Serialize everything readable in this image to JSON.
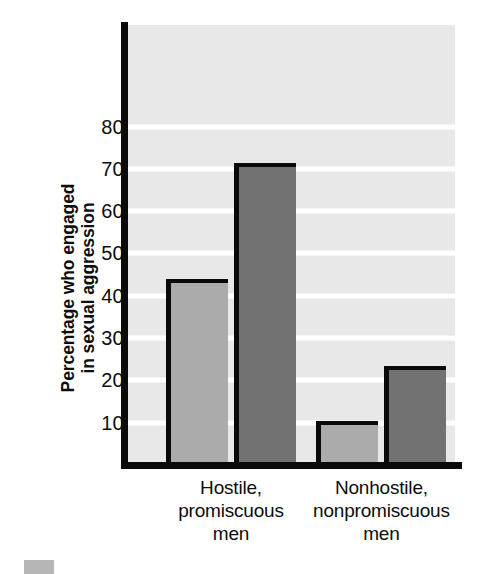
{
  "chart_data": {
    "type": "bar",
    "title": "",
    "xlabel": "",
    "ylabel": "Percentage who engaged\nin sexual aggression",
    "categories": [
      "Hostile,\npromiscuous\nmen",
      "Nonhostile,\nnonpromiscuous\nmen"
    ],
    "series": [
      {
        "name": "light-series",
        "values": [
          44,
          10.5
        ],
        "color": "#ababab"
      },
      {
        "name": "dark-series",
        "values": [
          71.5,
          23.5
        ],
        "color": "#727272"
      }
    ],
    "yticks": [
      10,
      20,
      30,
      40,
      50,
      60,
      70,
      80
    ],
    "ytick_labels": [
      "10",
      "20",
      "30",
      "40",
      "50",
      "60",
      "70",
      "80"
    ],
    "ylim": [
      0,
      104
    ],
    "grid": true,
    "grid_color": "#ffffff",
    "plot_background": "#e8e8e8",
    "axis_color": "#0a0a0a",
    "legend_position": "below-axis-clipped"
  },
  "axis": {
    "y_title": "Percentage who engaged\nin sexual aggression"
  },
  "categories": [
    {
      "label": "Hostile,\npromiscuous\nmen"
    },
    {
      "label": "Nonhostile,\nnonpromiscuous\nmen"
    }
  ],
  "ticks": [
    {
      "label": "80"
    },
    {
      "label": "70"
    },
    {
      "label": "60"
    },
    {
      "label": "50"
    },
    {
      "label": "40"
    },
    {
      "label": "30"
    },
    {
      "label": "20"
    },
    {
      "label": "10"
    }
  ]
}
